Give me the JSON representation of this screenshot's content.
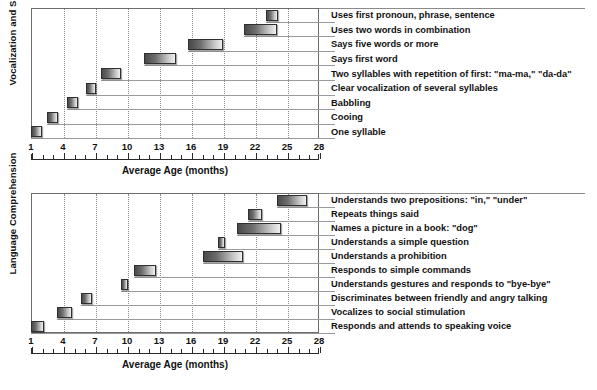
{
  "figure": {
    "axis": {
      "x_title": "Average Age (months)",
      "ticks": [
        "1",
        "4",
        "7",
        "10",
        "13",
        "16",
        "19",
        "22",
        "25",
        "28"
      ],
      "tick_values": [
        1,
        4,
        7,
        10,
        13,
        16,
        19,
        22,
        25,
        28
      ],
      "min": 1,
      "max": 28
    },
    "panels": [
      {
        "id": "vocalization-and-speech",
        "y_title": "Vocalization and Speech",
        "x_title": "Average Age (months)"
      },
      {
        "id": "language-comprehension",
        "y_title": "Language Comprehension",
        "x_title": "Average Age (months)"
      }
    ]
  },
  "chart_data": [
    {
      "type": "bar",
      "orientation": "horizontal",
      "subtype": "range-bar",
      "title": "Vocalization and Speech",
      "xlabel": "Average Age (months)",
      "ylabel": "Vocalization and Speech",
      "xlim": [
        1,
        28
      ],
      "xticks": [
        1,
        4,
        7,
        10,
        13,
        16,
        19,
        22,
        25,
        28
      ],
      "grid": "vertical-dotted",
      "legend": "none",
      "categories": [
        "Uses first pronoun, phrase, sentence",
        "Uses two words in combination",
        "Says five words or more",
        "Says first word",
        "Two syllables with repetition of first: \"ma-ma,\" \"da-da\"",
        "Clear vocalization of several syllables",
        "Babbling",
        "Cooing",
        "One syllable"
      ],
      "ranges": [
        [
          23.0,
          24.2
        ],
        [
          21.0,
          24.1
        ],
        [
          15.7,
          19.0
        ],
        [
          11.6,
          14.6
        ],
        [
          7.6,
          9.4
        ],
        [
          6.2,
          7.1
        ],
        [
          4.4,
          5.4
        ],
        [
          2.5,
          3.5
        ],
        [
          1.0,
          2.0
        ]
      ]
    },
    {
      "type": "bar",
      "orientation": "horizontal",
      "subtype": "range-bar",
      "title": "Language Comprehension",
      "xlabel": "Average Age (months)",
      "ylabel": "Language Comprehension",
      "xlim": [
        1,
        28
      ],
      "xticks": [
        1,
        4,
        7,
        10,
        13,
        16,
        19,
        22,
        25,
        28
      ],
      "grid": "vertical-dotted",
      "legend": "none",
      "categories": [
        "Understands two prepositions: \"in,\" \"under\"",
        "Repeats things said",
        "Names a picture in a book: \"dog\"",
        "Understands a simple question",
        "Understands a prohibition",
        "Responds to simple commands",
        "Understands gestures and responds to \"bye-bye\"",
        "Discriminates between friendly and angry talking",
        "Vocalizes to social stimulation",
        "Responds and attends to speaking voice"
      ],
      "ranges": [
        [
          24.1,
          26.9
        ],
        [
          21.3,
          22.7
        ],
        [
          20.3,
          24.4
        ],
        [
          18.5,
          19.2
        ],
        [
          17.1,
          20.9
        ],
        [
          10.7,
          12.7
        ],
        [
          9.4,
          10.1
        ],
        [
          5.7,
          6.7
        ],
        [
          3.4,
          4.8
        ],
        [
          1.0,
          2.2
        ]
      ]
    }
  ],
  "colors": {
    "bar_dark": "#4a4a4a",
    "bar_light": "#efefef",
    "bar_outline": "#2f2f2f",
    "grid": "#8a8a8a",
    "axis": "#2b2b2b",
    "leader": "#9a9a9a",
    "text": "#111111",
    "background": "#ffffff"
  }
}
